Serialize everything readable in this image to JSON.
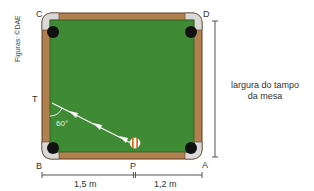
{
  "figure": {
    "credit": "Figuras: ©DAE",
    "points": {
      "C": "C",
      "D": "D",
      "T": "T",
      "B": "B",
      "P": "P",
      "A": "A"
    },
    "angle_label": "60°",
    "width_label_line1": "largura do tampo",
    "width_label_line2": "da mesa",
    "dimensions": {
      "BP": "1,5 m",
      "PA": "1,2 m"
    },
    "colors": {
      "felt": "#3f8a34",
      "rail": "#b0804f",
      "rail_border": "#5a3d22",
      "pocket": "#111111",
      "corner_cap": "#d9d9d9",
      "trajectory": "#ffffff",
      "ball_stripe": "#e0701f",
      "dimension_line": "#555555"
    }
  }
}
